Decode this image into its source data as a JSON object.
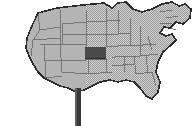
{
  "graphic": {
    "kind": "us-states-map-thumbnail",
    "title": "United States map with one state highlighted",
    "background_color": "#ffffff",
    "width": 193,
    "height": 126
  },
  "colors": {
    "background": "#ffffff",
    "west_fill": "#b4b4b4",
    "east_fill_halftone_light": "#d2d2d2",
    "east_fill_halftone_dark": "#9a9a9a",
    "highlight_fill": "#4a4a4a",
    "outline": "#2b2b2b",
    "state_border": "#6e6e6e",
    "pole": "#3a3a3a",
    "drop_shadow": "#1e1e1e"
  },
  "highlight": {
    "label": "highlighted-state",
    "region": "Great Plains",
    "fill": "#4a4a4a",
    "x": 85,
    "y": 47,
    "width": 21,
    "height": 12
  },
  "pole": {
    "label": "map-stand-pole",
    "x": 75,
    "y": 66,
    "width": 6,
    "height": 60,
    "fill": "#3a3a3a"
  },
  "regions": {
    "west_label": "western-states-solid-fill",
    "east_label": "eastern-states-halftone-fill",
    "outline_label": "national-outline"
  },
  "alt_text": "Small grayscale clip-art map of the contiguous United States mounted on a stand, with one central plains state shaded dark."
}
